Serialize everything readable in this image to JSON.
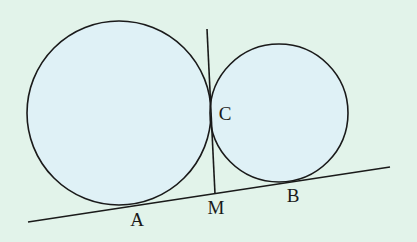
{
  "diagram": {
    "background": "#e2f3ea",
    "circle_fill": "#dff1f6",
    "stroke": "#1a1a1a",
    "circles": [
      {
        "name": "large-circle",
        "cx": 119,
        "cy": 113,
        "r": 92
      },
      {
        "name": "small-circle",
        "cx": 279,
        "cy": 113,
        "r": 69
      }
    ],
    "lines": [
      {
        "name": "common-external-tangent",
        "x1": 28,
        "y1": 222,
        "x2": 390,
        "y2": 167
      },
      {
        "name": "common-internal-tangent",
        "x1": 207,
        "y1": 29,
        "x2": 215,
        "y2": 194
      }
    ],
    "points": [
      {
        "name": "A",
        "label": "A",
        "x": 137,
        "y": 222
      },
      {
        "name": "M",
        "label": "M",
        "x": 216,
        "y": 210
      },
      {
        "name": "B",
        "label": "B",
        "x": 293,
        "y": 198
      },
      {
        "name": "C",
        "label": "C",
        "x": 225,
        "y": 116
      }
    ]
  }
}
